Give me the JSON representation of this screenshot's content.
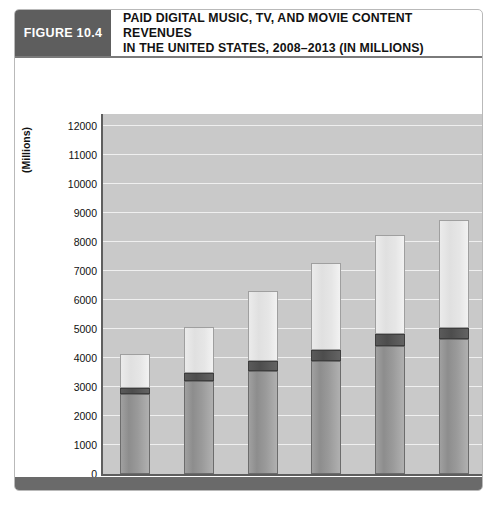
{
  "figure": {
    "tag": "FIGURE 10.4",
    "title_line1": "PAID DIGITAL MUSIC, TV, AND MOVIE CONTENT REVENUES",
    "title_line2": "IN THE UNITED STATES, 2008–2013 (IN MILLIONS)"
  },
  "colors": {
    "header_tag_bg": "#5e5e5e",
    "plot_bg": "#c9c9c9",
    "gridline": "#efefef",
    "axis": "#5e5e5e",
    "digital_music": "#9a9a9a",
    "online_tv": "#e6e6e6",
    "digital_movies": "#4d4d4d",
    "footer": "#6a6a6a"
  },
  "chart_data": {
    "type": "bar",
    "subtype": "stacked",
    "title": "PAID DIGITAL MUSIC, TV, AND MOVIE CONTENT REVENUES IN THE UNITED STATES, 2008–2013 (IN MILLIONS)",
    "xlabel": "Year",
    "ylabel": "(Millions)",
    "ylim": [
      0,
      12400
    ],
    "yticks": [
      0,
      1000,
      2000,
      3000,
      4000,
      5000,
      6000,
      7000,
      8000,
      9000,
      10000,
      11000,
      12000
    ],
    "ytick_labels": [
      "0",
      "1000",
      "2000",
      "3000",
      "4000",
      "5000",
      "6000",
      "7000",
      "8000",
      "9000",
      "10000",
      "11000",
      "12000"
    ],
    "grid": true,
    "legend_position": "bottom",
    "categories": [
      "2008",
      "2009",
      "2010",
      "2011",
      "2012",
      "2013"
    ],
    "series": [
      {
        "name": "Digital Music",
        "values": [
          2750,
          3200,
          3560,
          3880,
          4400,
          4650
        ]
      },
      {
        "name": "Digital Movies",
        "values": [
          210,
          270,
          330,
          400,
          420,
          380
        ]
      },
      {
        "name": "Online TV",
        "values": [
          1160,
          1600,
          2400,
          3000,
          3430,
          3720
        ]
      }
    ],
    "totals": [
      4120,
      5070,
      6290,
      7280,
      8250,
      8750
    ]
  },
  "legend": {
    "items": [
      {
        "label": "Digital Music",
        "swatch": "music-swatch"
      },
      {
        "label": "Online TV",
        "swatch": "tv-swatch"
      },
      {
        "label": "Digital Movies",
        "swatch": "movies-swatch"
      }
    ]
  }
}
